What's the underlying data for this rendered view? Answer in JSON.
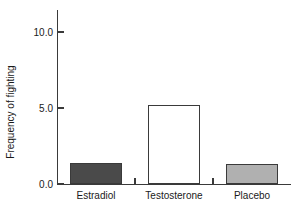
{
  "chart_data": {
    "type": "bar",
    "title": "",
    "subtitle": "",
    "xlabel": "",
    "ylabel": "Frequency of fighting",
    "categories": [
      "Estradiol",
      "Testosterone",
      "Placebo"
    ],
    "values": [
      1.4,
      5.2,
      1.3
    ],
    "series": [
      {
        "name": "Frequency of fighting",
        "values": [
          1.4,
          5.2,
          1.3
        ]
      }
    ],
    "bar_colors": [
      "#4a4a4a",
      "#ffffff",
      "#b0b0b0"
    ],
    "bar_edge_color": "#3a3a3a",
    "ylim": [
      0.0,
      11.5
    ],
    "yticks": [
      0.0,
      5.0,
      10.0
    ],
    "ytick_labels": [
      "0.0",
      "5.0",
      "10.0"
    ],
    "grid": false,
    "legend": null,
    "legend_position": "none",
    "annotations": []
  },
  "figure": {
    "background_color": "#ffffff",
    "axis_color": "#3a3a3a",
    "text_color": "#1a1a1a"
  }
}
